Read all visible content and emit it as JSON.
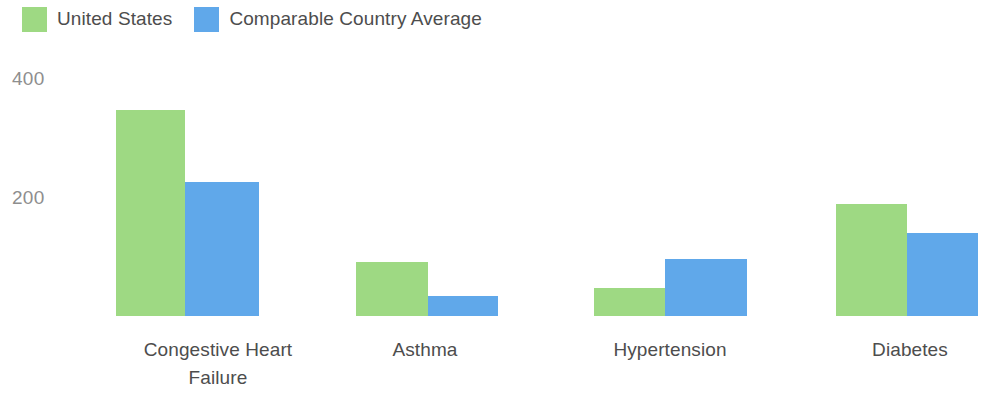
{
  "chart_data": {
    "type": "bar",
    "title": "",
    "xlabel": "",
    "ylabel": "",
    "categories": [
      "Congestive Heart Failure",
      "Asthma",
      "Hypertension",
      "Diabetes"
    ],
    "series": [
      {
        "name": "United States",
        "color": "#9ed983",
        "values": [
          346,
          91,
          47,
          188
        ]
      },
      {
        "name": "Comparable Country Average",
        "color": "#60a8ea",
        "values": [
          225,
          34,
          96,
          139
        ]
      }
    ],
    "ylim": [
      0,
      430
    ],
    "yticks": [
      200,
      400
    ],
    "ytick_labels": [
      "200",
      "400"
    ],
    "grid": false,
    "legend_position": "top-left"
  },
  "legend": {
    "items": [
      {
        "label": "United States",
        "swatch_name": "legend-swatch-united-states"
      },
      {
        "label": "Comparable Country Average",
        "swatch_name": "legend-swatch-comparable-country-average"
      }
    ]
  },
  "axis": {
    "y_tick_labels": [
      "400",
      "200"
    ]
  },
  "categories": [
    {
      "line1": "Congestive Heart",
      "line2": "Failure"
    },
    {
      "line1": "Asthma",
      "line2": ""
    },
    {
      "line1": "Hypertension",
      "line2": ""
    },
    {
      "line1": "Diabetes",
      "line2": ""
    }
  ]
}
